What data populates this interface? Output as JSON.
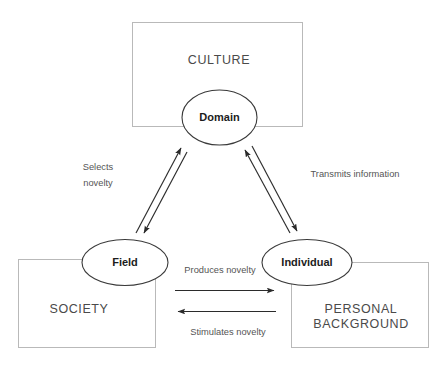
{
  "diagram": {
    "background_color": "#ffffff",
    "box_stroke_color": "#b9b9b9",
    "ellipse_stroke_color": "#3a3a3a",
    "arrow_color": "#2b2b2b",
    "box_label_color": "#4a4a4a",
    "node_label_color": "#1c1c1c",
    "edge_label_color": "#555555",
    "boxes": [
      {
        "id": "culture",
        "label": "CULTURE"
      },
      {
        "id": "society",
        "label": "SOCIETY"
      },
      {
        "id": "personal-background",
        "label_line1": "PERSONAL",
        "label_line2": "BACKGROUND"
      }
    ],
    "nodes": [
      {
        "id": "domain",
        "label": "Domain"
      },
      {
        "id": "field",
        "label": "Field"
      },
      {
        "id": "individual",
        "label": "Individual"
      }
    ],
    "edges": [
      {
        "id": "selects-novelty",
        "label_line1": "Selects",
        "label_line2": "novelty",
        "from": "domain",
        "to": "field",
        "direction": "bidirectional-pair"
      },
      {
        "id": "transmits-information",
        "label": "Transmits information",
        "from": "domain",
        "to": "individual",
        "direction": "bidirectional-pair"
      },
      {
        "id": "produces-novelty",
        "label": "Produces novelty",
        "from": "field",
        "to": "individual",
        "direction": "right"
      },
      {
        "id": "stimulates-novelty",
        "label": "Stimulates novelty",
        "from": "individual",
        "to": "field",
        "direction": "left"
      }
    ]
  }
}
